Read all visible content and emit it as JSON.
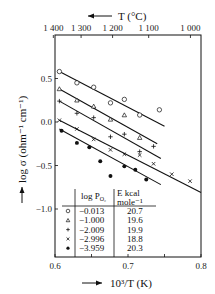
{
  "chart_data": {
    "type": "scatter",
    "title": "",
    "xlabel": "10^3/T (K)",
    "ylabel": "log σ (ohm⁻¹ cm⁻¹)",
    "top_xlabel": "T (°C)",
    "xlim": [
      0.6,
      0.8
    ],
    "ylim": [
      -1.5,
      0.85
    ],
    "x_ticks": [
      0.6,
      0.7,
      0.8
    ],
    "x_tick_labels": [
      "0.6",
      "0.7",
      "0.8"
    ],
    "y_ticks": [
      0.5,
      0.0,
      -0.5,
      -1.0
    ],
    "y_tick_labels": [
      "0.5",
      "0.0",
      "−0.5",
      "−1.0"
    ],
    "top_ticks_celsius": [
      1400,
      1300,
      1200,
      1100,
      1000
    ],
    "top_tick_labels": [
      "1 400",
      "1 300",
      "1 200",
      "1 100",
      "1 000"
    ],
    "grid": false,
    "legend_position": "lower-left inside",
    "legend_headers": [
      "log P_O2",
      "E kcal mole⁻¹"
    ],
    "series": [
      {
        "name": "−0.013",
        "marker": "open-circle",
        "E_kcal_per_mole": "20.7",
        "x": [
          0.606,
          0.63,
          0.653,
          0.676,
          0.695,
          0.716,
          0.743
        ],
        "y": [
          0.58,
          0.45,
          0.4,
          0.22,
          0.26,
          0.08,
          0.14
        ],
        "fit_line": {
          "x": [
            0.606,
            0.75
          ],
          "y": [
            0.58,
            -0.05
          ]
        }
      },
      {
        "name": "−1.000",
        "marker": "open-triangle",
        "E_kcal_per_mole": "19.6",
        "x": [
          0.606,
          0.63,
          0.653,
          0.676,
          0.695,
          0.716
        ],
        "y": [
          0.38,
          0.25,
          0.18,
          0.03,
          0.08,
          -0.18
        ],
        "fit_line": {
          "x": [
            0.606,
            0.74
          ],
          "y": [
            0.38,
            -0.25
          ]
        }
      },
      {
        "name": "−2.009",
        "marker": "plus",
        "E_kcal_per_mole": "19.9",
        "x": [
          0.606,
          0.63,
          0.653,
          0.676,
          0.695,
          0.716,
          0.735
        ],
        "y": [
          0.24,
          0.1,
          0.05,
          -0.17,
          -0.14,
          -0.34,
          -0.28
        ],
        "fit_line": {
          "x": [
            0.606,
            0.745
          ],
          "y": [
            0.24,
            -0.42
          ]
        }
      },
      {
        "name": "−2.996",
        "marker": "cross",
        "E_kcal_per_mole": "18.8",
        "x": [
          0.606,
          0.63,
          0.653,
          0.676,
          0.695,
          0.716,
          0.735,
          0.76,
          0.785
        ],
        "y": [
          0.02,
          -0.08,
          -0.2,
          -0.32,
          -0.37,
          -0.38,
          -0.48,
          -0.6,
          -0.68
        ],
        "fit_line": {
          "x": [
            0.606,
            0.8
          ],
          "y": [
            0.02,
            -0.81
          ]
        }
      },
      {
        "name": "−3.959",
        "marker": "filled-circle",
        "E_kcal_per_mole": "20.3",
        "x": [
          0.609,
          0.63,
          0.647,
          0.662,
          0.676,
          0.695,
          0.71,
          0.725
        ],
        "y": [
          -0.1,
          -0.24,
          -0.29,
          -0.45,
          -0.62,
          -0.51,
          -0.55,
          -0.66
        ],
        "fit_line": {
          "x": [
            0.606,
            0.745
          ],
          "y": [
            -0.08,
            -0.72
          ]
        }
      }
    ]
  },
  "axes": {
    "top_label": "T (°C)",
    "bottom_label": "10³/T (K)",
    "left_label": "log σ (ohm⁻¹ cm⁻¹)"
  },
  "legend": {
    "header_col1": "log P",
    "header_col1_sub": "O₂",
    "header_col2_line1": "E kcal",
    "header_col2_line2": "mole⁻¹",
    "rows": [
      {
        "symbol": "○",
        "logP": "−0.013",
        "E": "20.7"
      },
      {
        "symbol": "△",
        "logP": "−1.000",
        "E": "19.6"
      },
      {
        "symbol": "+",
        "logP": "−2.009",
        "E": "19.9"
      },
      {
        "symbol": "×",
        "logP": "−2.996",
        "E": "18.8"
      },
      {
        "symbol": "●",
        "logP": "−3.959",
        "E": "20.3"
      }
    ]
  }
}
